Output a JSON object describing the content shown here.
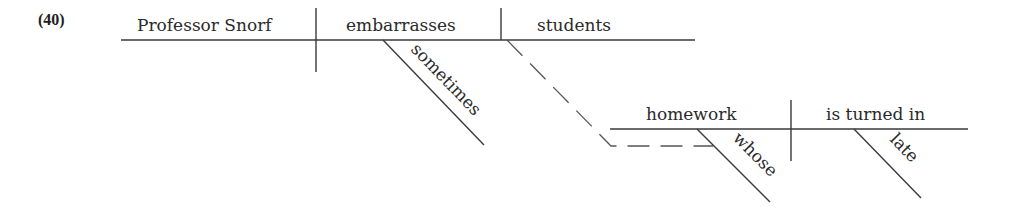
{
  "example_number": "(40)",
  "main_clause": {
    "subject": "Professor Snorf",
    "verb": "embarrasses",
    "object": "students",
    "modifiers": {
      "verb_adverb": "sometimes"
    }
  },
  "relative_clause": {
    "subject": "homework",
    "verb": "is turned in",
    "modifiers": {
      "subject_determiner": "whose",
      "verb_adverb": "late"
    },
    "connector": "dashed line linking 'students' to 'whose'"
  },
  "colors": {
    "line": "#3a3a3a",
    "text": "#2a2a2a",
    "background": "#ffffff"
  }
}
